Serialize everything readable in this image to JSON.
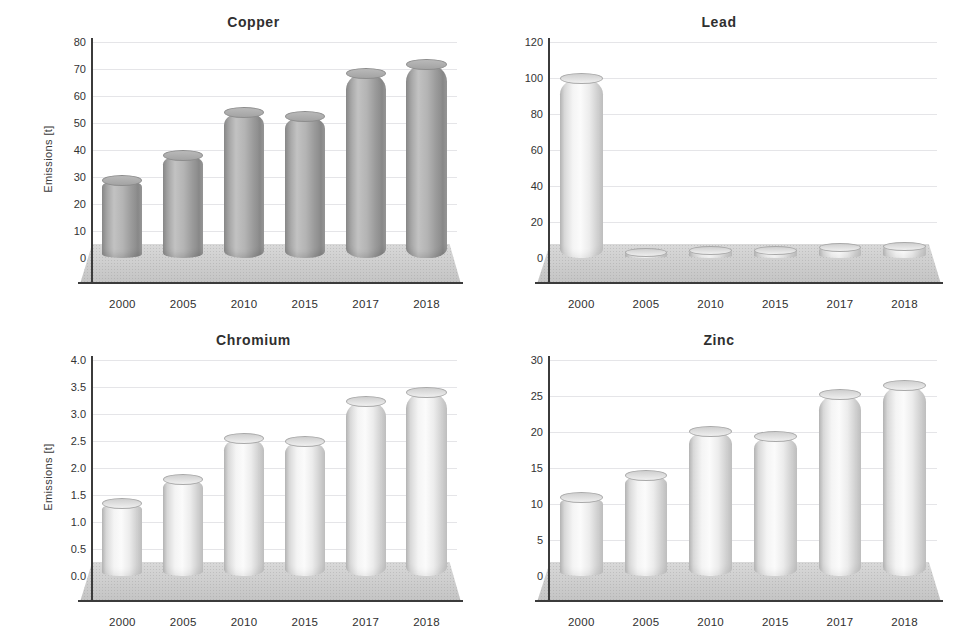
{
  "figure": {
    "panel_count": 4,
    "background_color": "#ffffff",
    "axis_color": "#3b3b3b",
    "gridline_color": "#aaaab4",
    "dark_bar_color": "#a5a5a5",
    "light_bar_color": "#f0f0f0",
    "floor_color": "#c9c9c9"
  },
  "chart_data": [
    {
      "type": "bar",
      "title": "Copper",
      "xlabel": "",
      "ylabel": "Emissions [t]",
      "categories": [
        "2000",
        "2005",
        "2010",
        "2015",
        "2017",
        "2018"
      ],
      "values": [
        29,
        38,
        54,
        52.5,
        68.5,
        72
      ],
      "yticks": [
        0,
        10,
        20,
        30,
        40,
        50,
        60,
        70,
        80
      ],
      "ytick_labels": [
        "0",
        "10",
        "20",
        "30",
        "40",
        "50",
        "60",
        "70",
        "80"
      ],
      "ylim": [
        0,
        80
      ],
      "grid": true,
      "legend": false,
      "style": "3d-cylinder",
      "bar_shade": "dark"
    },
    {
      "type": "bar",
      "title": "Lead",
      "xlabel": "",
      "ylabel": "",
      "categories": [
        "2000",
        "2005",
        "2010",
        "2015",
        "2017",
        "2018"
      ],
      "values": [
        100,
        3,
        4.5,
        4.5,
        6,
        6.5
      ],
      "yticks": [
        0,
        20,
        40,
        60,
        80,
        100,
        120
      ],
      "ytick_labels": [
        "0",
        "20",
        "40",
        "60",
        "80",
        "100",
        "120"
      ],
      "ylim": [
        0,
        120
      ],
      "grid": true,
      "legend": false,
      "style": "3d-cylinder",
      "bar_shade": "light"
    },
    {
      "type": "bar",
      "title": "Chromium",
      "xlabel": "",
      "ylabel": "Emissions [t]",
      "categories": [
        "2000",
        "2005",
        "2010",
        "2015",
        "2017",
        "2018"
      ],
      "values": [
        1.35,
        1.8,
        2.55,
        2.5,
        3.25,
        3.4
      ],
      "yticks": [
        0.0,
        0.5,
        1.0,
        1.5,
        2.0,
        2.5,
        3.0,
        3.5,
        4.0
      ],
      "ytick_labels": [
        "0.0",
        "0.5",
        "1.0",
        "1.5",
        "2.0",
        "2.5",
        "3.0",
        "3.5",
        "4.0"
      ],
      "ylim": [
        0,
        4.0
      ],
      "grid": true,
      "legend": false,
      "style": "3d-cylinder",
      "bar_shade": "light"
    },
    {
      "type": "bar",
      "title": "Zinc",
      "xlabel": "",
      "ylabel": "",
      "categories": [
        "2000",
        "2005",
        "2010",
        "2015",
        "2017",
        "2018"
      ],
      "values": [
        11,
        14,
        20.2,
        19.5,
        25.3,
        26.5
      ],
      "yticks": [
        0,
        5,
        10,
        15,
        20,
        25,
        30
      ],
      "ytick_labels": [
        "0",
        "5",
        "10",
        "15",
        "20",
        "25",
        "30"
      ],
      "ylim": [
        0,
        30
      ],
      "grid": true,
      "legend": false,
      "style": "3d-cylinder",
      "bar_shade": "light"
    }
  ]
}
